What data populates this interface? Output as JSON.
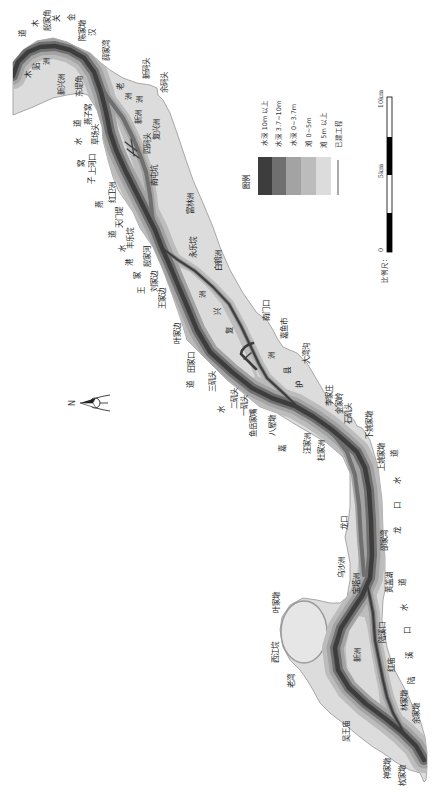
{
  "map": {
    "north_arrow": {
      "label": "N"
    },
    "legend": {
      "title": "图例",
      "items": [
        {
          "label": "水深 10m 以上",
          "color": "#3d3d3d"
        },
        {
          "label": "水深 3.7~10m",
          "color": "#6f6f6f"
        },
        {
          "label": "水深 0~3.7m",
          "color": "#a3a3a3"
        },
        {
          "label": "滩 0~5m",
          "color": "#bcbcbc"
        },
        {
          "label": "滩 5m 以上",
          "color": "#dcdcdc"
        },
        {
          "label": "已建工程",
          "color": "#555555"
        }
      ]
    },
    "scale_bar": {
      "title": "比例尺：",
      "ticks": [
        "0",
        "5km",
        "10km"
      ]
    },
    "labels": [
      {
        "text": "道",
        "x": 23,
        "y": 33
      },
      {
        "text": "木",
        "x": 36,
        "y": 23
      },
      {
        "text": "殷家角",
        "x": 48,
        "y": 20
      },
      {
        "text": "关",
        "x": 57,
        "y": 18
      },
      {
        "text": "金",
        "x": 72,
        "y": 17
      },
      {
        "text": "陈家墩",
        "x": 83,
        "y": 30
      },
      {
        "text": "汉",
        "x": 93,
        "y": 32
      },
      {
        "text": "薛家湾",
        "x": 107,
        "y": 50
      },
      {
        "text": "新码头",
        "x": 147,
        "y": 68
      },
      {
        "text": "余码头",
        "x": 165,
        "y": 82
      },
      {
        "text": "木",
        "x": 29,
        "y": 74
      },
      {
        "text": "贴",
        "x": 37,
        "y": 66
      },
      {
        "text": "洲",
        "x": 47,
        "y": 61
      },
      {
        "text": "新兴洲",
        "x": 62,
        "y": 84
      },
      {
        "text": "东堤角",
        "x": 80,
        "y": 86
      },
      {
        "text": "老",
        "x": 121,
        "y": 86
      },
      {
        "text": "洲",
        "x": 129,
        "y": 96
      },
      {
        "text": "洲",
        "x": 140,
        "y": 99
      },
      {
        "text": "新洲",
        "x": 139,
        "y": 117
      },
      {
        "text": "燕子窝",
        "x": 89,
        "y": 114
      },
      {
        "text": "道",
        "x": 78,
        "y": 123
      },
      {
        "text": "水",
        "x": 79,
        "y": 141
      },
      {
        "text": "草场头",
        "x": 96,
        "y": 134
      },
      {
        "text": "四码头",
        "x": 148,
        "y": 143
      },
      {
        "text": "复兴洲",
        "x": 157,
        "y": 129
      },
      {
        "text": "窝",
        "x": 82,
        "y": 163
      },
      {
        "text": "上河口",
        "x": 93,
        "y": 164
      },
      {
        "text": "子",
        "x": 92,
        "y": 180
      },
      {
        "text": "南屯坑",
        "x": 155,
        "y": 175
      },
      {
        "text": "红卫洲",
        "x": 113,
        "y": 192
      },
      {
        "text": "燕",
        "x": 100,
        "y": 204
      },
      {
        "text": "天门堤",
        "x": 120,
        "y": 217
      },
      {
        "text": "富林洲",
        "x": 191,
        "y": 203
      },
      {
        "text": "道",
        "x": 113,
        "y": 234
      },
      {
        "text": "丰乐垸",
        "x": 131,
        "y": 238
      },
      {
        "text": "水",
        "x": 123,
        "y": 248
      },
      {
        "text": "永乐垸",
        "x": 194,
        "y": 247
      },
      {
        "text": "港",
        "x": 130,
        "y": 262
      },
      {
        "text": "殷家河",
        "x": 148,
        "y": 256
      },
      {
        "text": "白鹤洲",
        "x": 219,
        "y": 260
      },
      {
        "text": "家",
        "x": 138,
        "y": 275
      },
      {
        "text": "刘家边",
        "x": 155,
        "y": 281
      },
      {
        "text": "王",
        "x": 142,
        "y": 290
      },
      {
        "text": "洲",
        "x": 203,
        "y": 294
      },
      {
        "text": "王家边",
        "x": 163,
        "y": 298
      },
      {
        "text": "兴",
        "x": 218,
        "y": 311
      },
      {
        "text": "南门口",
        "x": 267,
        "y": 310
      },
      {
        "text": "叶家边",
        "x": 178,
        "y": 333
      },
      {
        "text": "嘉鱼市",
        "x": 285,
        "y": 328
      },
      {
        "text": "复",
        "x": 230,
        "y": 330
      },
      {
        "text": "大湾沟",
        "x": 307,
        "y": 353
      },
      {
        "text": "洲",
        "x": 272,
        "y": 355
      },
      {
        "text": "田家口",
        "x": 192,
        "y": 362
      },
      {
        "text": "县",
        "x": 288,
        "y": 370
      },
      {
        "text": "三矶头",
        "x": 213,
        "y": 381
      },
      {
        "text": "道",
        "x": 191,
        "y": 384
      },
      {
        "text": "护",
        "x": 300,
        "y": 384
      },
      {
        "text": "李家庄",
        "x": 330,
        "y": 395
      },
      {
        "text": "二矶头",
        "x": 235,
        "y": 398
      },
      {
        "text": "金家岭",
        "x": 340,
        "y": 403
      },
      {
        "text": "一矶头",
        "x": 245,
        "y": 405
      },
      {
        "text": "水",
        "x": 222,
        "y": 409
      },
      {
        "text": "石矶头",
        "x": 349,
        "y": 413
      },
      {
        "text": "鱼岳家嘴",
        "x": 254,
        "y": 423
      },
      {
        "text": "八屋墩",
        "x": 273,
        "y": 425
      },
      {
        "text": "下姚家墩",
        "x": 370,
        "y": 425
      },
      {
        "text": "汪家洲",
        "x": 308,
        "y": 443
      },
      {
        "text": "嘉",
        "x": 283,
        "y": 448
      },
      {
        "text": "杜家洲",
        "x": 322,
        "y": 450
      },
      {
        "text": "道",
        "x": 395,
        "y": 453
      },
      {
        "text": "上姚家墩",
        "x": 382,
        "y": 457
      },
      {
        "text": "水",
        "x": 398,
        "y": 480
      },
      {
        "text": "口",
        "x": 398,
        "y": 505
      },
      {
        "text": "龙口",
        "x": 345,
        "y": 523
      },
      {
        "text": "龙",
        "x": 398,
        "y": 530
      },
      {
        "text": "邵家湾",
        "x": 385,
        "y": 540
      },
      {
        "text": "乌沙洲",
        "x": 342,
        "y": 567
      },
      {
        "text": "宝塔洲",
        "x": 357,
        "y": 583
      },
      {
        "text": "黄盖湖",
        "x": 390,
        "y": 582
      },
      {
        "text": "道",
        "x": 403,
        "y": 582
      },
      {
        "text": "叶家墩",
        "x": 277,
        "y": 602
      },
      {
        "text": "水",
        "x": 405,
        "y": 607
      },
      {
        "text": "陆溪口",
        "x": 383,
        "y": 632
      },
      {
        "text": "口",
        "x": 408,
        "y": 630
      },
      {
        "text": "西江垸",
        "x": 276,
        "y": 652
      },
      {
        "text": "新洲",
        "x": 358,
        "y": 655
      },
      {
        "text": "溪",
        "x": 410,
        "y": 655
      },
      {
        "text": "红庙",
        "x": 392,
        "y": 665
      },
      {
        "text": "陆",
        "x": 412,
        "y": 680
      },
      {
        "text": "老湾",
        "x": 292,
        "y": 681
      },
      {
        "text": "林家墩",
        "x": 405,
        "y": 700
      },
      {
        "text": "余家墩",
        "x": 417,
        "y": 713
      },
      {
        "text": "吴王庙",
        "x": 347,
        "y": 731
      },
      {
        "text": "神家墩",
        "x": 388,
        "y": 768
      },
      {
        "text": "枚家墩",
        "x": 403,
        "y": 775
      }
    ]
  }
}
